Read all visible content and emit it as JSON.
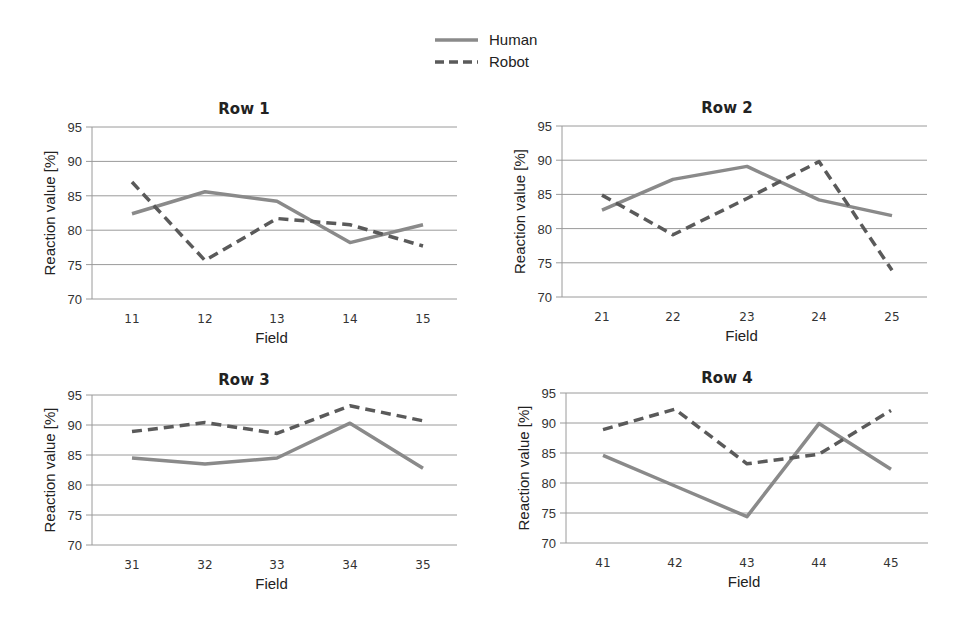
{
  "legend": {
    "items": [
      {
        "label": "Human",
        "style": "solid",
        "color": "#8a8a8a"
      },
      {
        "label": "Robot",
        "style": "dashed",
        "color": "#5a5a5a"
      }
    ]
  },
  "chart_data": [
    {
      "type": "line",
      "title": "Row 1",
      "xlabel": "Field",
      "ylabel": "Reaction value [%]",
      "categories": [
        "11",
        "12",
        "13",
        "14",
        "15"
      ],
      "yticks": [
        70,
        75,
        80,
        85,
        90,
        95
      ],
      "ylim": [
        70,
        95
      ],
      "grid": true,
      "series": [
        {
          "name": "Human",
          "values": [
            82.4,
            85.6,
            84.2,
            78.2,
            80.8
          ]
        },
        {
          "name": "Robot",
          "values": [
            87.0,
            75.6,
            81.7,
            80.8,
            77.7
          ]
        }
      ]
    },
    {
      "type": "line",
      "title": "Row 2",
      "xlabel": "Field",
      "ylabel": "Reaction value [%]",
      "categories": [
        "21",
        "22",
        "23",
        "24",
        "25"
      ],
      "yticks": [
        70,
        75,
        80,
        85,
        90,
        95
      ],
      "ylim": [
        70,
        95
      ],
      "grid": true,
      "series": [
        {
          "name": "Human",
          "values": [
            82.7,
            87.2,
            89.1,
            84.2,
            81.9
          ]
        },
        {
          "name": "Robot",
          "values": [
            84.9,
            79.1,
            84.4,
            89.8,
            73.9
          ]
        }
      ]
    },
    {
      "type": "line",
      "title": "Row 3",
      "xlabel": "Field",
      "ylabel": "Reaction value [%]",
      "categories": [
        "31",
        "32",
        "33",
        "34",
        "35"
      ],
      "yticks": [
        70,
        75,
        80,
        85,
        90,
        95
      ],
      "ylim": [
        70,
        95
      ],
      "grid": true,
      "series": [
        {
          "name": "Human",
          "values": [
            84.5,
            83.5,
            84.5,
            90.3,
            82.8
          ]
        },
        {
          "name": "Robot",
          "values": [
            88.9,
            90.4,
            88.6,
            93.2,
            90.7
          ]
        }
      ]
    },
    {
      "type": "line",
      "title": "Row 4",
      "xlabel": "Field",
      "ylabel": "Reaction value [%]",
      "categories": [
        "41",
        "42",
        "43",
        "44",
        "45"
      ],
      "yticks": [
        70,
        75,
        80,
        85,
        90,
        95
      ],
      "ylim": [
        70,
        95
      ],
      "grid": true,
      "series": [
        {
          "name": "Human",
          "values": [
            84.6,
            79.5,
            74.4,
            89.9,
            82.3
          ]
        },
        {
          "name": "Robot",
          "values": [
            88.9,
            92.3,
            83.2,
            84.8,
            92.1
          ]
        }
      ]
    }
  ]
}
